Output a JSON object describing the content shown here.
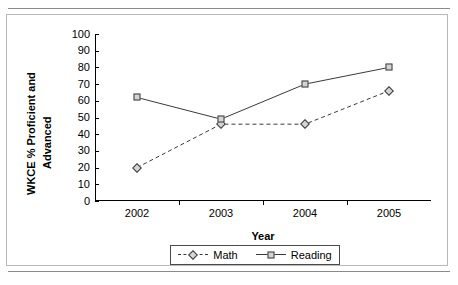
{
  "chart_data": {
    "type": "line",
    "title": "",
    "subtitle": "",
    "xlabel": "Year",
    "ylabel": "WKCE % Proficient and Advanced",
    "ylabel_line1": "WKCE % Proficient and",
    "ylabel_line2": "Advanced",
    "categories": [
      "2002",
      "2003",
      "2004",
      "2005"
    ],
    "ylim": [
      0,
      100
    ],
    "yticks": [
      100,
      90,
      80,
      70,
      60,
      50,
      40,
      30,
      20,
      10,
      0
    ],
    "grid": false,
    "legend_position": "bottom",
    "series": [
      {
        "name": "Math",
        "values": [
          20,
          46,
          46,
          66
        ],
        "line_style": "dashed",
        "marker": "diamond",
        "color": "#3a3a3a",
        "marker_fill": "#d4d4d4"
      },
      {
        "name": "Reading",
        "values": [
          62,
          49,
          70,
          80
        ],
        "line_style": "solid",
        "marker": "square",
        "color": "#3a3a3a",
        "marker_fill": "#d4d4d4"
      }
    ]
  },
  "figure": {
    "border_color": "#b8b8b8",
    "background": "#ffffff",
    "rule_color": "#8a8a8a"
  },
  "legend": {
    "items": [
      {
        "label": "Math",
        "style": "dashed",
        "marker": "diamond"
      },
      {
        "label": "Reading",
        "style": "solid",
        "marker": "square"
      }
    ]
  }
}
